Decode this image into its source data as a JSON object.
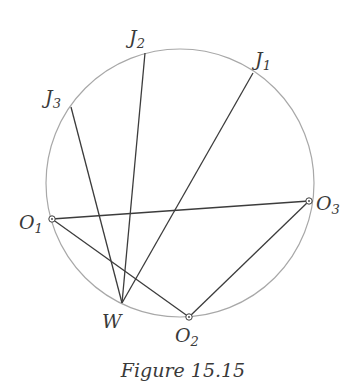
{
  "figure": {
    "caption": "Figure 15.15",
    "colors": {
      "circle": "#a8a8a8",
      "line": "#3c3c3c",
      "text": "#3a3a3a"
    }
  },
  "circle": {
    "cx": 180,
    "cy": 183,
    "r": 134
  },
  "points": {
    "J1": {
      "label": "J",
      "sub": "1",
      "x": 253,
      "y": 73
    },
    "J2": {
      "label": "J",
      "sub": "2",
      "x": 145,
      "y": 53
    },
    "J3": {
      "label": "J",
      "sub": "3",
      "x": 71,
      "y": 107
    },
    "O1": {
      "label": "O",
      "sub": "1",
      "x": 52,
      "y": 219
    },
    "O2": {
      "label": "O",
      "sub": "2",
      "x": 189,
      "y": 317
    },
    "O3": {
      "label": "O",
      "sub": "3",
      "x": 309,
      "y": 201
    },
    "W": {
      "label": "W",
      "sub": "",
      "x": 122,
      "y": 303
    }
  },
  "segments": [
    [
      "W",
      "J1"
    ],
    [
      "W",
      "J2"
    ],
    [
      "W",
      "J3"
    ],
    [
      "O1",
      "O3"
    ],
    [
      "O1",
      "O2"
    ],
    [
      "O2",
      "O3"
    ]
  ]
}
